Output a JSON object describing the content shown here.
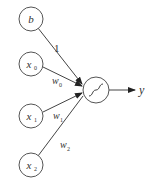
{
  "diagram": {
    "title": "",
    "type": "perceptron / single neuron",
    "inputs": [
      {
        "id": "b",
        "label": "b",
        "sub": "",
        "weight": "1",
        "weight_sub": ""
      },
      {
        "id": "x0",
        "label": "x",
        "sub": "0",
        "weight": "w",
        "weight_sub": "0"
      },
      {
        "id": "x1",
        "label": "x",
        "sub": "1",
        "weight": "w",
        "weight_sub": "1"
      },
      {
        "id": "x2",
        "label": "x",
        "sub": "2",
        "weight": "w",
        "weight_sub": "2"
      }
    ],
    "neuron": {
      "activation": "sigmoid-icon"
    },
    "output": {
      "label": "y"
    },
    "colors": {
      "stroke": "#555555",
      "text": "#333333",
      "background": "#ffffff"
    }
  }
}
